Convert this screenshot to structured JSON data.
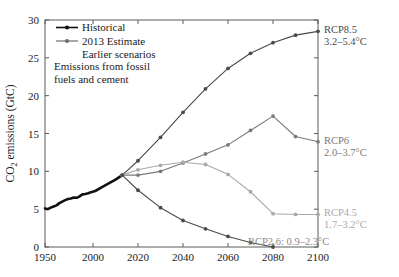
{
  "chart_data": {
    "type": "line",
    "title": "",
    "xlabel": "",
    "ylabel": "CO2 emissions (GtC)",
    "ylabel_rich": "CO₂ emissions (GtC)",
    "xlim": [
      1950,
      2100
    ],
    "ylim": [
      0,
      30
    ],
    "xticks": [
      1950,
      2000,
      2020,
      2040,
      2060,
      2080,
      2100
    ],
    "xtick_labels": [
      "1950",
      "2000",
      "2020",
      "2040",
      "2060",
      "2080",
      "2100"
    ],
    "yticks": [
      0,
      5,
      10,
      15,
      20,
      25,
      30
    ],
    "ytick_labels": [
      "0",
      "5",
      "10",
      "15",
      "20",
      "25",
      "30"
    ],
    "grid": false,
    "legend_position": "upper-left",
    "annotation": "Emissions from fossil\nfuels and cement",
    "annotation_line1": "Emissions from fossil",
    "annotation_line2": "fuels and cement",
    "legend": [
      {
        "label": "Historical",
        "marker": "dot",
        "color": "#111111"
      },
      {
        "label": "2013 Estimate",
        "marker": "dot",
        "color": "#6e6e6e"
      },
      {
        "label": "Earlier scenarios",
        "marker": "none",
        "color": "#1a1a1a"
      }
    ],
    "series": [
      {
        "name": "Historical",
        "color": "#111111",
        "linewidth": 2.6,
        "x": [
          1950,
          1953,
          1956,
          1959,
          1962,
          1965,
          1968,
          1971,
          1974,
          1977,
          1980,
          1983,
          1986,
          1989,
          1992,
          1995,
          1998,
          2001,
          2004,
          2007,
          2010,
          2013
        ],
        "y": [
          5.1,
          5.0,
          5.2,
          5.35,
          5.5,
          5.8,
          6.0,
          6.2,
          6.35,
          6.4,
          6.55,
          6.5,
          6.7,
          6.95,
          7.0,
          7.1,
          7.25,
          7.4,
          7.9,
          8.4,
          8.9,
          9.5
        ]
      },
      {
        "name": "RCP8.5",
        "color": "#4a4a4a",
        "linewidth": 1.1,
        "x": [
          2013,
          2020,
          2030,
          2040,
          2050,
          2060,
          2070,
          2080,
          2090,
          2100
        ],
        "y": [
          9.5,
          11.4,
          14.5,
          17.8,
          20.9,
          23.6,
          25.6,
          27.0,
          28.0,
          28.5
        ]
      },
      {
        "name": "RCP6",
        "color": "#7a7a7a",
        "linewidth": 1.1,
        "x": [
          2013,
          2020,
          2030,
          2040,
          2050,
          2060,
          2070,
          2080,
          2090,
          2100
        ],
        "y": [
          9.5,
          9.5,
          10.0,
          11.1,
          12.3,
          13.5,
          15.4,
          17.3,
          14.6,
          13.9
        ]
      },
      {
        "name": "RCP4.5",
        "color": "#a9a9a9",
        "linewidth": 1.1,
        "x": [
          2013,
          2020,
          2030,
          2040,
          2050,
          2060,
          2070,
          2080,
          2090,
          2100
        ],
        "y": [
          9.5,
          10.2,
          10.8,
          11.2,
          10.9,
          9.6,
          7.3,
          4.4,
          4.3,
          4.3
        ]
      },
      {
        "name": "RCP2.6",
        "color": "#4a4a4a",
        "linewidth": 1.1,
        "x": [
          2013,
          2020,
          2030,
          2040,
          2050,
          2060,
          2070,
          2080
        ],
        "y": [
          9.5,
          7.5,
          5.2,
          3.5,
          2.4,
          1.4,
          0.6,
          0.0
        ]
      }
    ],
    "endpoint_labels": [
      {
        "name": "RCP8.5",
        "line1": "RCP8.5",
        "line2": "3.2–5.4°C",
        "color": "#4a4a4a",
        "at_y": 28.5
      },
      {
        "name": "RCP6",
        "line1": "RCP6",
        "line2": "2.0–3.7°C",
        "color": "#7a7a7a",
        "at_y": 13.9
      },
      {
        "name": "RCP4.5",
        "line1": "RCP4.5",
        "line2": "1.7–3.2°C",
        "color": "#a9a9a9",
        "at_y": 4.3
      }
    ],
    "inline_labels": [
      {
        "name": "RCP2.6",
        "text": "RCP2.6: 0.9–2.3°C",
        "color": "#8a8a8a"
      }
    ]
  }
}
